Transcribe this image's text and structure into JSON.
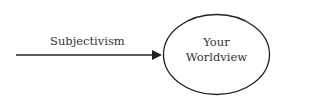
{
  "diagram": {
    "edge": {
      "label": "Subjectivism",
      "from": "left",
      "to": "worldview-node"
    },
    "node": {
      "line1": "Your",
      "line2": "Worldview",
      "shape": "ellipse"
    },
    "colors": {
      "stroke": "#222222",
      "text": "#333333",
      "background": "#ffffff"
    }
  }
}
